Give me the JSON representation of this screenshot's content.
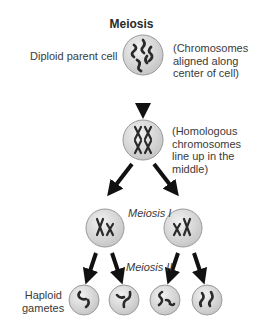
{
  "title": "Meiosis",
  "labels": {
    "parent_cell": "Diploid parent cell",
    "parent_note": [
      "(Chromosomes",
      "aligned along",
      "center of cell)"
    ],
    "homologous_note": [
      "(Homologous",
      "chromosomes",
      "line up in the",
      "middle)"
    ],
    "meiosis_1": "Meiosis I",
    "meiosis_2": "Meiosis II",
    "gametes": [
      "Haploid",
      "gametes"
    ]
  },
  "colors": {
    "cell_fill": "#d9d9d9",
    "cell_stroke": "#9a9a9a",
    "chromosome": "#2a2a2a",
    "arrow": "#111111"
  }
}
